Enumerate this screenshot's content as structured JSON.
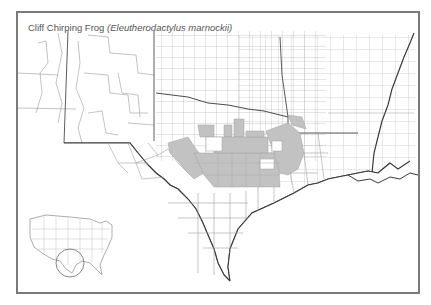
{
  "title": {
    "common_name": "Cliff Chirping Frog",
    "scientific_name": "(Eleutherodactylus marnockii)"
  },
  "map": {
    "region": "Texas and surrounding states (county boundaries)",
    "range_fill_color": "#c2c2c2",
    "county_line_color": "#9a9a9a",
    "state_line_color": "#4a4a4a",
    "frame_color": "#7a7a7a",
    "range_description": "Shaded counties in central Texas (Edwards Plateau / Balcones Escarpment)"
  },
  "inset": {
    "label": "United States locator map",
    "highlight": "Circle around Texas"
  }
}
